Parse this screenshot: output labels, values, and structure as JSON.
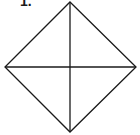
{
  "figure": {
    "label": "1.",
    "shape": "square rotated 45° (rhombus) with both diagonals",
    "stroke_color": "#1a1a1a",
    "vertices": {
      "top": [
        70,
        2
      ],
      "right": [
        136,
        67
      ],
      "bottom": [
        70,
        132
      ],
      "left": [
        5,
        67
      ]
    },
    "center": [
      70,
      67
    ]
  }
}
